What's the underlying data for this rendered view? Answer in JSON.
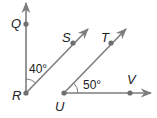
{
  "diagram": {
    "line_color": "#7d7d7d",
    "point_color": "#6f6f6f",
    "points": [
      {
        "name": "Q",
        "x": 26,
        "y": 24,
        "label_x": 11,
        "label_y": 28
      },
      {
        "name": "R",
        "x": 26,
        "y": 93,
        "label_x": 12,
        "label_y": 100
      },
      {
        "name": "S",
        "x": 73,
        "y": 43,
        "label_x": 62,
        "label_y": 42
      },
      {
        "name": "T",
        "x": 111,
        "y": 43,
        "label_x": 101,
        "label_y": 42
      },
      {
        "name": "U",
        "x": 64,
        "y": 93,
        "label_x": 55,
        "label_y": 111
      },
      {
        "name": "V",
        "x": 130,
        "y": 93,
        "label_x": 127,
        "label_y": 84
      }
    ],
    "rays": [
      {
        "name": "ray-RQ",
        "from": "R",
        "x1": 26,
        "y1": 93,
        "x2": 26,
        "y2": 3
      },
      {
        "name": "ray-RS",
        "from": "R",
        "x1": 26,
        "y1": 93,
        "x2": 88,
        "y2": 29
      },
      {
        "name": "ray-UT",
        "from": "U",
        "x1": 64,
        "y1": 93,
        "x2": 126,
        "y2": 29
      },
      {
        "name": "ray-UV",
        "from": "U",
        "x1": 64,
        "y1": 93,
        "x2": 151,
        "y2": 93
      }
    ],
    "angles": [
      {
        "name": "angle-QRS",
        "label": "40°",
        "label_x": 29,
        "label_y": 73
      },
      {
        "name": "angle-TUV",
        "label": "50°",
        "label_x": 83,
        "label_y": 89
      }
    ]
  }
}
